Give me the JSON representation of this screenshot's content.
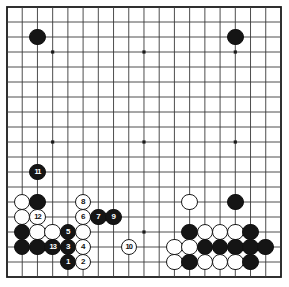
{
  "diagram": {
    "type": "go-board",
    "board_size": 19,
    "background_color": "#ffffff",
    "line_color": "#3a3a3a",
    "border_color": "#1a1a1a",
    "black_color": "#151515",
    "white_color": "#ffffff",
    "geometry": {
      "left": 7,
      "top": 7,
      "right": 281,
      "bottom": 277,
      "col_step": 15.22,
      "row_step": 15.0,
      "stone_diameter": 16.5
    },
    "star_points": [
      {
        "col": 3,
        "row": 3
      },
      {
        "col": 9,
        "row": 3
      },
      {
        "col": 15,
        "row": 3
      },
      {
        "col": 3,
        "row": 9
      },
      {
        "col": 9,
        "row": 9
      },
      {
        "col": 15,
        "row": 9
      },
      {
        "col": 3,
        "row": 15
      },
      {
        "col": 9,
        "row": 15
      },
      {
        "col": 15,
        "row": 15
      }
    ],
    "stones": [
      {
        "col": 2,
        "row": 2,
        "color": "black",
        "label": ""
      },
      {
        "col": 15,
        "row": 2,
        "color": "black",
        "label": ""
      },
      {
        "col": 2,
        "row": 11,
        "color": "black",
        "label": "11"
      },
      {
        "col": 1,
        "row": 13,
        "color": "white",
        "label": ""
      },
      {
        "col": 2,
        "row": 13,
        "color": "black",
        "label": ""
      },
      {
        "col": 5,
        "row": 13,
        "color": "white",
        "label": "8"
      },
      {
        "col": 12,
        "row": 13,
        "color": "white",
        "label": ""
      },
      {
        "col": 15,
        "row": 13,
        "color": "black",
        "label": ""
      },
      {
        "col": 1,
        "row": 14,
        "color": "white",
        "label": ""
      },
      {
        "col": 2,
        "row": 14,
        "color": "white",
        "label": "12"
      },
      {
        "col": 5,
        "row": 14,
        "color": "white",
        "label": "6"
      },
      {
        "col": 6,
        "row": 14,
        "color": "black",
        "label": "7"
      },
      {
        "col": 7,
        "row": 14,
        "color": "black",
        "label": "9"
      },
      {
        "col": 1,
        "row": 15,
        "color": "black",
        "label": ""
      },
      {
        "col": 2,
        "row": 15,
        "color": "white",
        "label": ""
      },
      {
        "col": 3,
        "row": 15,
        "color": "white",
        "label": ""
      },
      {
        "col": 4,
        "row": 15,
        "color": "black",
        "label": "5"
      },
      {
        "col": 5,
        "row": 15,
        "color": "white",
        "label": ""
      },
      {
        "col": 12,
        "row": 15,
        "color": "black",
        "label": ""
      },
      {
        "col": 13,
        "row": 15,
        "color": "white",
        "label": ""
      },
      {
        "col": 14,
        "row": 15,
        "color": "white",
        "label": ""
      },
      {
        "col": 15,
        "row": 15,
        "color": "white",
        "label": ""
      },
      {
        "col": 16,
        "row": 15,
        "color": "black",
        "label": ""
      },
      {
        "col": 1,
        "row": 16,
        "color": "black",
        "label": ""
      },
      {
        "col": 2,
        "row": 16,
        "color": "black",
        "label": ""
      },
      {
        "col": 3,
        "row": 16,
        "color": "black",
        "label": "13"
      },
      {
        "col": 4,
        "row": 16,
        "color": "black",
        "label": "3"
      },
      {
        "col": 5,
        "row": 16,
        "color": "white",
        "label": "4"
      },
      {
        "col": 8,
        "row": 16,
        "color": "white",
        "label": "10"
      },
      {
        "col": 11,
        "row": 16,
        "color": "white",
        "label": ""
      },
      {
        "col": 12,
        "row": 16,
        "color": "white",
        "label": ""
      },
      {
        "col": 13,
        "row": 16,
        "color": "black",
        "label": ""
      },
      {
        "col": 14,
        "row": 16,
        "color": "black",
        "label": ""
      },
      {
        "col": 15,
        "row": 16,
        "color": "black",
        "label": ""
      },
      {
        "col": 16,
        "row": 16,
        "color": "black",
        "label": ""
      },
      {
        "col": 17,
        "row": 16,
        "color": "black",
        "label": ""
      },
      {
        "col": 4,
        "row": 17,
        "color": "black",
        "label": "1"
      },
      {
        "col": 5,
        "row": 17,
        "color": "white",
        "label": "2"
      },
      {
        "col": 11,
        "row": 17,
        "color": "white",
        "label": ""
      },
      {
        "col": 12,
        "row": 17,
        "color": "black",
        "label": ""
      },
      {
        "col": 13,
        "row": 17,
        "color": "white",
        "label": ""
      },
      {
        "col": 14,
        "row": 17,
        "color": "white",
        "label": ""
      },
      {
        "col": 15,
        "row": 17,
        "color": "white",
        "label": ""
      },
      {
        "col": 16,
        "row": 17,
        "color": "black",
        "label": ""
      }
    ],
    "move_labels": [
      "1",
      "2",
      "3",
      "4",
      "5",
      "6",
      "7",
      "8",
      "9",
      "10",
      "11",
      "12",
      "13"
    ]
  }
}
